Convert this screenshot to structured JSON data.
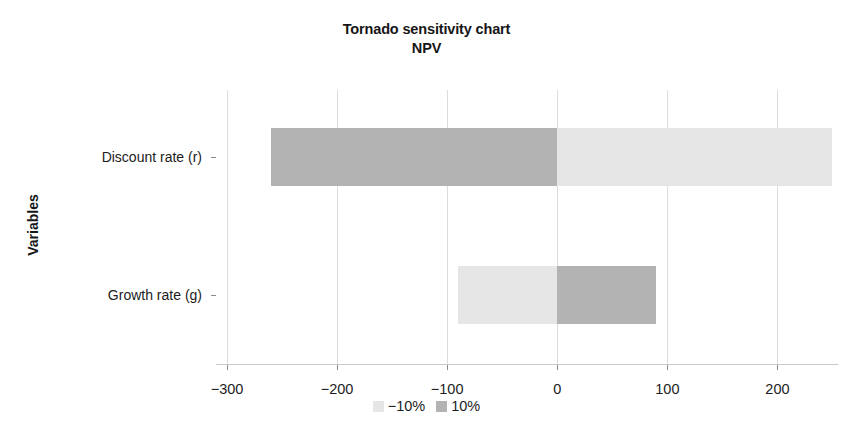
{
  "chart_data": {
    "type": "bar",
    "title": "Tornado sensitivity chart",
    "subtitle": "NPV",
    "xlabel": "",
    "ylabel": "Variables",
    "orientation": "horizontal",
    "grid": true,
    "legend_position": "bottom",
    "xlim": [
      -310,
      255
    ],
    "xticks": [
      -300,
      -200,
      -100,
      0,
      100,
      200
    ],
    "xtick_labels": [
      "−300",
      "−200",
      "−100",
      "0",
      "100",
      "200"
    ],
    "categories": [
      "Discount rate (r)",
      "Growth rate (g)"
    ],
    "series": [
      {
        "name": "−10%",
        "color": "#e6e6e6",
        "values": [
          250,
          -90
        ]
      },
      {
        "name": "10%",
        "color": "#b3b3b3",
        "values": [
          -260,
          90
        ]
      }
    ],
    "bars": [
      {
        "category": "Discount rate (r)",
        "low_value": -260,
        "low_series": "10%",
        "low_color": "#b3b3b3",
        "high_value": 250,
        "high_series": "−10%",
        "high_color": "#e6e6e6"
      },
      {
        "category": "Growth rate (g)",
        "low_value": -90,
        "low_series": "−10%",
        "low_color": "#e6e6e6",
        "high_value": 90,
        "high_series": "10%",
        "high_color": "#b3b3b3"
      }
    ]
  },
  "legend": {
    "items": [
      {
        "label": "−10%",
        "color": "#e6e6e6"
      },
      {
        "label": "10%",
        "color": "#b3b3b3"
      }
    ]
  },
  "colors": {
    "dark_gray": "#b3b3b3",
    "light_gray": "#e6e6e6",
    "gridline": "#dcdcdc",
    "axis": "#8a8a8a",
    "text": "#1c1c1c",
    "background": "#ffffff"
  }
}
